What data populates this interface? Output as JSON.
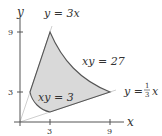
{
  "figure": {
    "axes": {
      "x_label": "x",
      "y_label": "y",
      "x_ticks": [
        "3",
        "9"
      ],
      "y_ticks": [
        "3",
        "9"
      ]
    },
    "curves": {
      "line_steep": "y = 3x",
      "hyperbola_outer": "xy = 27",
      "hyperbola_inner": "xy = 3",
      "line_shallow_prefix": "y = ",
      "line_shallow_num": "1",
      "line_shallow_den": "3",
      "line_shallow_var": "x"
    },
    "colors": {
      "region_fill": "#d9d9d9",
      "region_stroke": "#555555",
      "axis": "#555555",
      "guide_line": "#cccccc"
    }
  }
}
